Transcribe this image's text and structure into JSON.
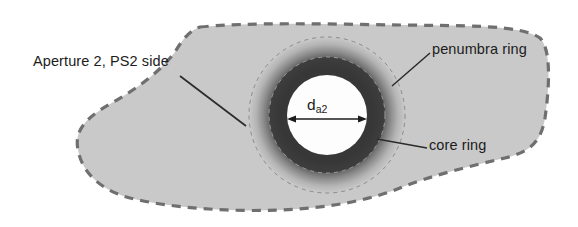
{
  "figure": {
    "background_color": "#ffffff",
    "width": 578,
    "height": 227
  },
  "labels": {
    "aperture": "Aperture 2, PS2 side",
    "penumbra": "penumbra ring",
    "core": "core ring",
    "diameter_symbol": "d",
    "diameter_subscript": "a2"
  },
  "colors": {
    "blob_fill": "#c9c9c9",
    "blob_outline": "#6f6f6f",
    "core_ring": "#3a3a3a",
    "penumbra_inner": "#4a4a4a",
    "penumbra_outer": "#c9c9c9",
    "aperture_fill": "#fdfdfd",
    "text": "#1c1c1c",
    "leader_line": "#2b2b2b",
    "dashed_circle": "#8a8a8a"
  },
  "geometry": {
    "center_x": 327,
    "center_y": 115,
    "aperture_radius": 40,
    "core_outer_radius": 58,
    "penumbra_outer_radius": 78,
    "aperture_diameter_px": 80
  },
  "elements": {
    "blob_outline_style": "dashed",
    "dimension_arrow": "double-headed horizontal arrow across aperture",
    "leaders": [
      "aperture-leader",
      "penumbra-leader",
      "core-leader"
    ]
  }
}
